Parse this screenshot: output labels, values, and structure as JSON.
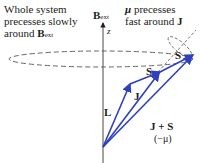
{
  "annotations": {
    "left_line1": "Whole system",
    "left_line2": "precesses slowly",
    "left_line3_prefix": "around ",
    "left_line3_vec": "B",
    "left_line3_sub": "ext",
    "right_line1_vec": "μ",
    "right_line1_rest": " precesses",
    "right_line2_prefix": "fast around ",
    "right_line2_vec": "J"
  },
  "axis": {
    "label_vec": "B",
    "label_sub": "ext",
    "z_label": "z"
  },
  "vectors": {
    "L": "L",
    "J": "J",
    "S_mid": "S",
    "S_tip": "S",
    "JS_line1": "J + S",
    "JS_line2": "(−μ)"
  },
  "colors": {
    "vector": "#2e3fbf",
    "dashed": "#555555",
    "text": "#222222"
  }
}
